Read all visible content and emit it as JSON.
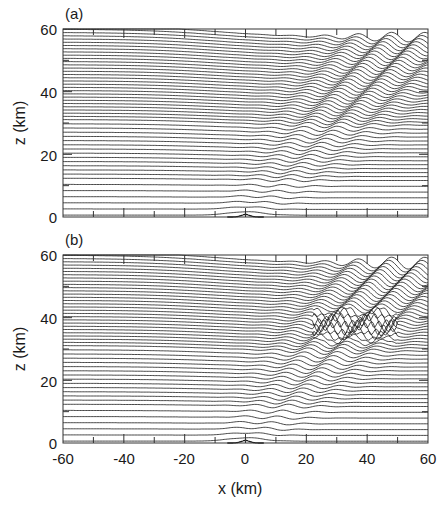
{
  "chart_data": [
    {
      "type": "line",
      "panel_label": "(a)",
      "title": "",
      "description": "Streamlines (isentropes) of flow over an isolated ridge at x=0 showing vertically propagating mountain waves tilting upstream-to-downstream with height",
      "xlabel": "x (km)",
      "ylabel": "z (km)",
      "xlim": [
        -60,
        60
      ],
      "ylim": [
        0,
        60
      ],
      "x_ticks": [
        -60,
        -40,
        -20,
        0,
        20,
        40,
        60
      ],
      "y_ticks": [
        0,
        20,
        40,
        60
      ],
      "minor_x_ticks_every": 10,
      "minor_y_ticks_every": 10,
      "grid": false,
      "wave_breaking": false,
      "wave_region": {
        "x_range": [
          0,
          55
        ],
        "z_range": [
          0,
          58
        ]
      }
    },
    {
      "type": "line",
      "panel_label": "(b)",
      "title": "",
      "description": "Same streamline field at a later stage with overturning / wave breaking near z≈40 km, x≈25–50 km",
      "xlabel": "x (km)",
      "ylabel": "z (km)",
      "xlim": [
        -60,
        60
      ],
      "ylim": [
        0,
        60
      ],
      "x_ticks": [
        -60,
        -40,
        -20,
        0,
        20,
        40,
        60
      ],
      "y_ticks": [
        0,
        20,
        40,
        60
      ],
      "minor_x_ticks_every": 10,
      "minor_y_ticks_every": 10,
      "grid": false,
      "wave_breaking": true,
      "breaking_region": {
        "x_range": [
          22,
          50
        ],
        "z_range": [
          33,
          44
        ]
      }
    }
  ],
  "labels": {
    "panel_a": "(a)",
    "panel_b": "(b)",
    "xlabel": "x (km)",
    "ylabel": "z (km)",
    "yticks": [
      "60",
      "40",
      "20",
      "0"
    ],
    "xticks": [
      "-60",
      "-40",
      "-20",
      "0",
      "20",
      "40",
      "60"
    ]
  },
  "colors": {
    "line": "#1a1a1a",
    "frame": "#333333",
    "background": "#ffffff"
  }
}
